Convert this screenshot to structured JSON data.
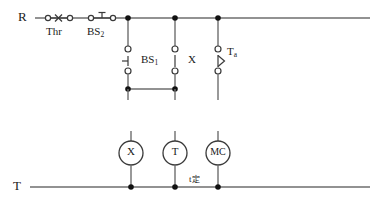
{
  "diagram": {
    "kind": "motor-control-ladder-circuit",
    "rails": {
      "top": {
        "label": "R",
        "y": 18,
        "x_start": 35,
        "x_end": 370
      },
      "bottom": {
        "label": "T",
        "y": 187,
        "x_start": 30,
        "x_end": 370
      }
    },
    "series_contacts": [
      {
        "name": "Thr",
        "label": "Thr",
        "type": "normally-closed-thermal-overload",
        "x": 57,
        "label_x": 44,
        "label_y": 26
      },
      {
        "name": "BS2",
        "label": "BS",
        "sub": "2",
        "type": "normally-closed-pushbutton",
        "x": 100,
        "label_x": 85,
        "label_y": 26
      }
    ],
    "branches": [
      {
        "name": "BS1",
        "label": "BS",
        "sub": "1",
        "type": "normally-open-pushbutton",
        "x": 128,
        "label_x": 143,
        "label_y": 47
      },
      {
        "name": "X",
        "label": "X",
        "sub": "",
        "type": "normally-open-contact",
        "x": 175,
        "label_x": 190,
        "label_y": 47
      },
      {
        "name": "Ta",
        "label": "T",
        "sub": "a",
        "type": "time-delay-contact",
        "x": 218,
        "label_x": 230,
        "label_y": 47
      }
    ],
    "junction_dots_top": [
      128,
      175,
      218
    ],
    "tie_bar": {
      "y": 89,
      "x_start": 128,
      "x_end": 175
    },
    "coils": [
      {
        "name": "X",
        "label": "X",
        "cx": 131,
        "cy": 153,
        "r": 12
      },
      {
        "name": "T",
        "label": "T",
        "cx": 175,
        "cy": 153,
        "r": 12
      },
      {
        "name": "MC",
        "label": "MC",
        "cx": 218,
        "cy": 153,
        "r": 12
      }
    ],
    "annotations": [
      {
        "name": "time-setting",
        "text": "t",
        "cjk": "定",
        "x": 190,
        "y": 177
      }
    ],
    "colors": {
      "wire": "#6e6e6e",
      "device": "#3a3a3a",
      "node": "#111111",
      "text": "#1a1a1a",
      "background": "#ffffff"
    }
  }
}
